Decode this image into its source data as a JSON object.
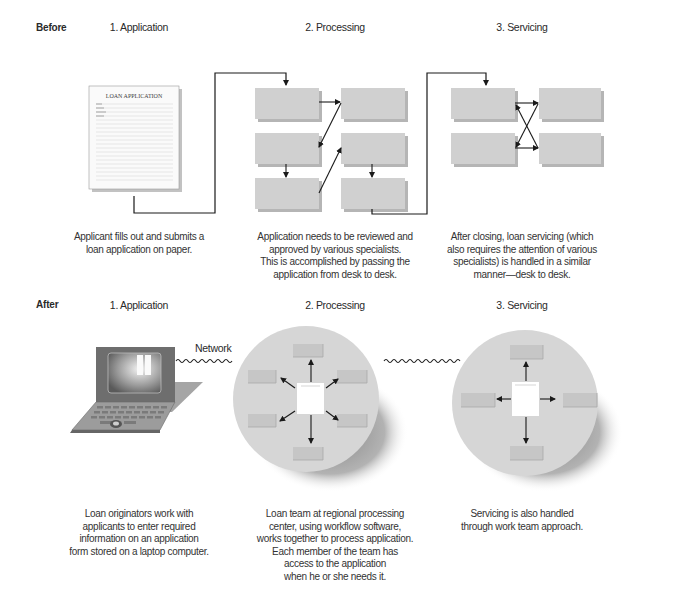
{
  "before": {
    "row_label": "Before",
    "stages": [
      {
        "label": "1. Application",
        "caption": "Applicant fills out and submits a\nloan application on paper."
      },
      {
        "label": "2. Processing",
        "caption": "Application needs to be reviewed and\napproved by various specialists.\nThis is accomplished by passing the\napplication from desk to desk."
      },
      {
        "label": "3. Servicing",
        "caption": "After closing, loan servicing (which\nalso requires the attention of various\nspecialists) is handled in a similar\nmanner—desk to desk."
      }
    ],
    "document_title": "LOAN APPLICATION"
  },
  "after": {
    "row_label": "After",
    "stages": [
      {
        "label": "1. Application",
        "caption": "Loan originators work with\napplicants to enter required\ninformation on an application\nform stored on a laptop computer."
      },
      {
        "label": "2. Processing",
        "caption": "Loan team at regional processing\ncenter, using workflow software,\nworks together to process application.\nEach member of the team has\naccess to the application\nwhen he or she needs it."
      },
      {
        "label": "3. Servicing",
        "caption": "Servicing is also handled\nthrough work team approach."
      }
    ],
    "network_label": "Network"
  },
  "colors": {
    "desk_box": "#cfcfcf",
    "circle": "#d6d6d6",
    "laptop_body": "#6e6e6e",
    "line": "#1a1a1a"
  }
}
